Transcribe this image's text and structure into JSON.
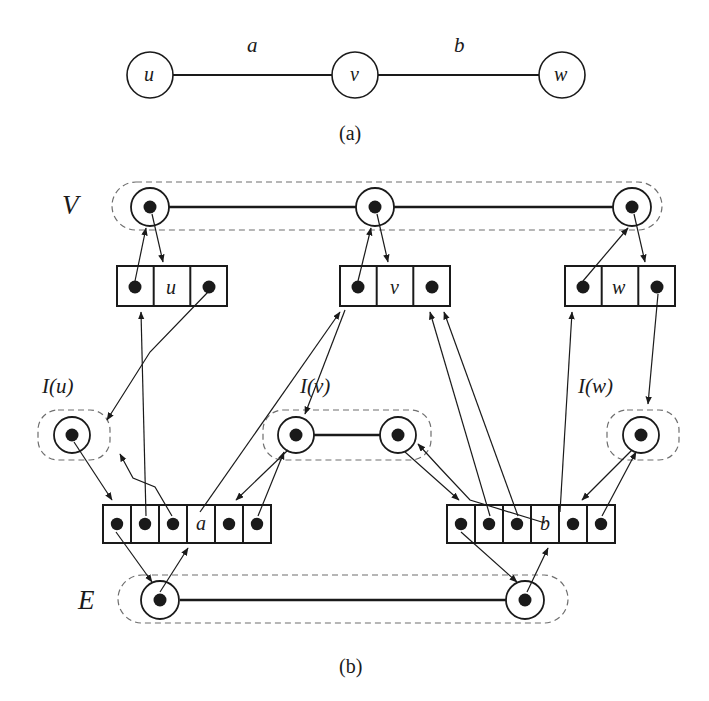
{
  "figure": {
    "panels": [
      {
        "id": "a",
        "caption": "(a)"
      },
      {
        "id": "b",
        "caption": "(b)"
      }
    ]
  },
  "panel_a": {
    "caption": "(a)",
    "vertices": [
      {
        "id": "u",
        "label": "u",
        "cx": 150,
        "cy": 75
      },
      {
        "id": "v",
        "label": "v",
        "cx": 355,
        "cy": 75
      },
      {
        "id": "w",
        "label": "w",
        "cx": 562,
        "cy": 75
      }
    ],
    "edges": [
      {
        "id": "a",
        "label": "a",
        "from": "u",
        "to": "v",
        "lx": 252,
        "ly": 45
      },
      {
        "id": "b",
        "label": "b",
        "from": "v",
        "to": "w",
        "lx": 459,
        "ly": 45
      }
    ]
  },
  "panel_b": {
    "caption": "(b)",
    "set_labels": [
      {
        "id": "V",
        "label": "V",
        "x": 62,
        "y": 188
      },
      {
        "id": "I_u",
        "label": "I(u)",
        "x": 42,
        "y": 375
      },
      {
        "id": "I_v",
        "label": "I(v)",
        "x": 300,
        "y": 375
      },
      {
        "id": "I_w",
        "label": "I(w)",
        "x": 578,
        "y": 375
      },
      {
        "id": "E",
        "label": "E",
        "x": 78,
        "y": 588
      }
    ],
    "V_group": {
      "name": "V",
      "box": {
        "x": 112,
        "y": 182,
        "w": 550,
        "h": 48
      },
      "nodes": [
        {
          "id": "V_u",
          "cx": 150,
          "cy": 207
        },
        {
          "id": "V_v",
          "cx": 375,
          "cy": 207
        },
        {
          "id": "V_w",
          "cx": 632,
          "cy": 207
        }
      ]
    },
    "I_groups": [
      {
        "name": "I(u)",
        "box": {
          "x": 38,
          "y": 410,
          "w": 72,
          "h": 50
        },
        "nodes": [
          {
            "id": "Iu_1",
            "cx": 72,
            "cy": 435
          }
        ]
      },
      {
        "name": "I(v)",
        "box": {
          "x": 263,
          "y": 410,
          "w": 168,
          "h": 50
        },
        "nodes": [
          {
            "id": "Iv_1",
            "cx": 296,
            "cy": 435
          },
          {
            "id": "Iv_2",
            "cx": 398,
            "cy": 435
          }
        ]
      },
      {
        "name": "I(w)",
        "box": {
          "x": 607,
          "y": 410,
          "w": 72,
          "h": 50
        },
        "nodes": [
          {
            "id": "Iw_1",
            "cx": 641,
            "cy": 435
          }
        ]
      }
    ],
    "E_group": {
      "name": "E",
      "box": {
        "x": 118,
        "y": 575,
        "w": 450,
        "h": 48
      },
      "nodes": [
        {
          "id": "E_a",
          "cx": 160,
          "cy": 600
        },
        {
          "id": "E_b",
          "cx": 525,
          "cy": 600
        }
      ]
    },
    "vertex_records": [
      {
        "id": "rec_u",
        "label": "u",
        "x": 117,
        "y": 266,
        "w": 110,
        "h": 40,
        "cells": [
          "dot",
          "label",
          "dot"
        ]
      },
      {
        "id": "rec_v",
        "label": "v",
        "x": 340,
        "y": 266,
        "w": 110,
        "h": 40,
        "cells": [
          "dot",
          "label",
          "dot"
        ]
      },
      {
        "id": "rec_w",
        "label": "w",
        "x": 565,
        "y": 266,
        "w": 110,
        "h": 40,
        "cells": [
          "dot",
          "label",
          "dot"
        ]
      }
    ],
    "edge_records": [
      {
        "id": "rec_a",
        "label": "a",
        "x": 103,
        "y": 505,
        "w": 168,
        "h": 38,
        "cells": [
          "dot",
          "dot",
          "dot",
          "label",
          "dot",
          "dot"
        ]
      },
      {
        "id": "rec_b",
        "label": "b",
        "x": 447,
        "y": 505,
        "w": 168,
        "h": 38,
        "cells": [
          "dot",
          "dot",
          "dot",
          "label",
          "dot",
          "dot"
        ]
      }
    ]
  },
  "style": {
    "stroke": "#1a1a1a",
    "dashed_stroke": "#6e6e6e",
    "fill": "#ffffff",
    "dot_fill": "#1a1a1a",
    "thin": 1.1,
    "thick": 2.2
  }
}
